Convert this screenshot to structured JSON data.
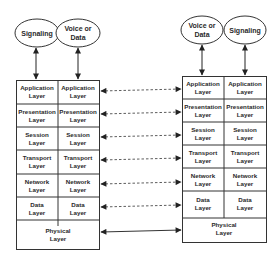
{
  "diagram": {
    "type": "OSI protocol stack comparison",
    "left_stack": {
      "ovals": [
        {
          "label_line1": "Signaling",
          "label_line2": ""
        },
        {
          "label_line1": "Voice or",
          "label_line2": "Data"
        }
      ],
      "layers": [
        {
          "col1": [
            "Application",
            "Layer"
          ],
          "col2": [
            "Application",
            "Layer"
          ]
        },
        {
          "col1": [
            "Presentation",
            "Layer"
          ],
          "col2": [
            "Presentation",
            "Layer"
          ]
        },
        {
          "col1": [
            "Session",
            "Layer"
          ],
          "col2": [
            "Session",
            "Layer"
          ]
        },
        {
          "col1": [
            "Transport",
            "Layer"
          ],
          "col2": [
            "Transport",
            "Layer"
          ]
        },
        {
          "col1": [
            "Network",
            "Layer"
          ],
          "col2": [
            "Network",
            "Layer"
          ]
        },
        {
          "col1": [
            "Data",
            "Layer"
          ],
          "col2": [
            "Data",
            "Layer"
          ]
        }
      ],
      "physical": [
        "Physical",
        "Layer"
      ]
    },
    "right_stack": {
      "ovals": [
        {
          "label_line1": "Voice or",
          "label_line2": "Data"
        },
        {
          "label_line1": "Signaling",
          "label_line2": ""
        }
      ],
      "layers": [
        {
          "col1": [
            "Application",
            "Layer"
          ],
          "col2": [
            "Application",
            "Layer"
          ]
        },
        {
          "col1": [
            "Presentation",
            "Layer"
          ],
          "col2": [
            "Presentation",
            "Layer"
          ]
        },
        {
          "col1": [
            "Session",
            "Layer"
          ],
          "col2": [
            "Session",
            "Layer"
          ]
        },
        {
          "col1": [
            "Transport",
            "Layer"
          ],
          "col2": [
            "Transport",
            "Layer"
          ]
        },
        {
          "col1": [
            "Network",
            "Layer"
          ],
          "col2": [
            "Network",
            "Layer"
          ]
        },
        {
          "col1": [
            "Data",
            "Layer"
          ],
          "col2": [
            "Data",
            "Layer"
          ]
        }
      ],
      "physical": [
        "Physical",
        "Layer"
      ]
    },
    "connections": {
      "peer_layers_style": "dashed",
      "physical_style": "solid",
      "arrowheads": "both"
    },
    "colors": {
      "stroke": "#333333",
      "text": "#2a2a2a",
      "background": "#ffffff"
    }
  }
}
